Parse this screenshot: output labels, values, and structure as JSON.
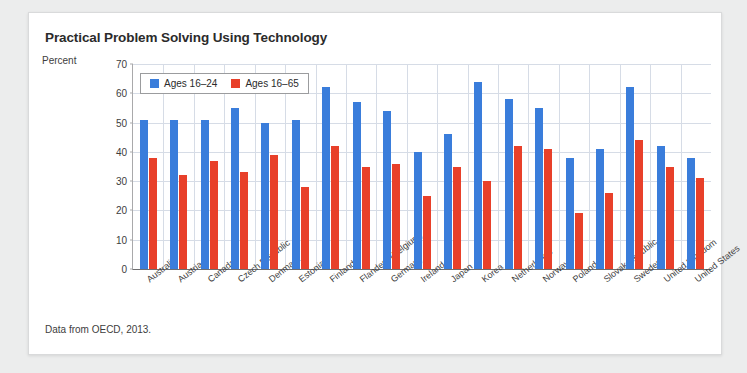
{
  "card": {
    "title": "Practical Problem Solving Using Technology",
    "source_note": "Data from OECD, 2013."
  },
  "legend": {
    "position": "top-left-inside",
    "entries": [
      {
        "label": "Ages 16–24",
        "color": "#3a7ddb",
        "swatch": "legend-swatch-blue"
      },
      {
        "label": "Ages 16–65",
        "color": "#e8402a",
        "swatch": "legend-swatch-red"
      }
    ]
  },
  "chart_data": {
    "type": "bar",
    "title": "Practical Problem Solving Using Technology",
    "subtitle": "",
    "xlabel": "",
    "ylabel": "Percent",
    "ylim": [
      0,
      70
    ],
    "yticks": [
      0,
      10,
      20,
      30,
      40,
      50,
      60,
      70
    ],
    "grid": true,
    "legend_position": "upper left",
    "annotation": "Data from OECD, 2013.",
    "categories": [
      "Australia",
      "Austria",
      "Canada",
      "Czech Republic",
      "Denmark",
      "Estonia",
      "Finland",
      "Flanders (Belgium)",
      "Germany",
      "Ireland",
      "Japan",
      "Korea",
      "Netherlands",
      "Norway",
      "Poland",
      "Slovak Republic",
      "Sweden",
      "United Kingdom",
      "United States"
    ],
    "series": [
      {
        "name": "Ages 16–24",
        "color": "#3a7ddb",
        "values": [
          51,
          51,
          51,
          55,
          50,
          51,
          62,
          57,
          54,
          40,
          46,
          64,
          58,
          55,
          38,
          41,
          62,
          42,
          38
        ]
      },
      {
        "name": "Ages 16–65",
        "color": "#e8402a",
        "values": [
          38,
          32,
          37,
          33,
          39,
          28,
          42,
          35,
          36,
          25,
          35,
          30,
          42,
          41,
          19,
          26,
          44,
          35,
          31
        ]
      }
    ]
  }
}
